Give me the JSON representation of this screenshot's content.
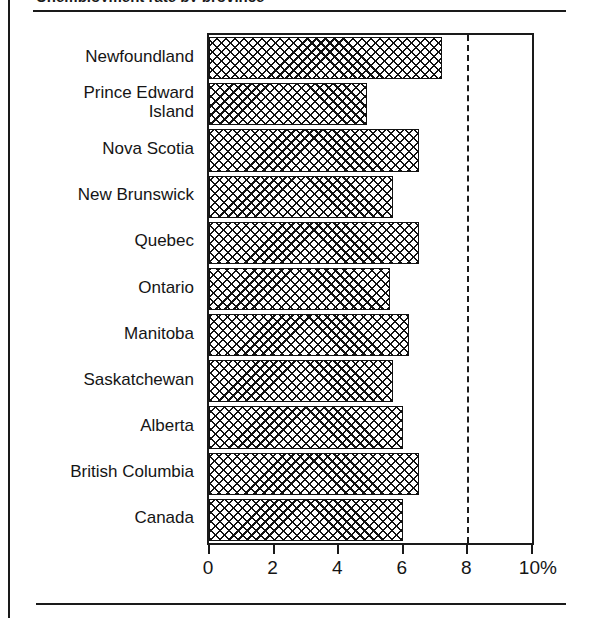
{
  "page": {
    "title_cropped": "Unemployment rate by province",
    "rules": {
      "top": true,
      "bottom": true,
      "left_border": true
    }
  },
  "chart_data": {
    "type": "bar",
    "orientation": "horizontal",
    "title": "",
    "xlabel": "",
    "ylabel": "",
    "categories": [
      "Newfoundland",
      "Prince Edward Island",
      "Nova Scotia",
      "New Brunswick",
      "Quebec",
      "Ontario",
      "Manitoba",
      "Saskatchewan",
      "Alberta",
      "British Columbia",
      "Canada"
    ],
    "category_labels_wrapped": [
      [
        "Newfoundland"
      ],
      [
        "Prince Edward",
        "Island"
      ],
      [
        "Nova Scotia"
      ],
      [
        "New Brunswick"
      ],
      [
        "Quebec"
      ],
      [
        "Ontario"
      ],
      [
        "Manitoba"
      ],
      [
        "Saskatchewan"
      ],
      [
        "Alberta"
      ],
      [
        "British Columbia"
      ],
      [
        "Canada"
      ]
    ],
    "values": [
      7.2,
      4.9,
      6.5,
      5.7,
      6.5,
      5.6,
      6.2,
      5.7,
      6.0,
      6.5,
      6.0
    ],
    "xlim": [
      0,
      10
    ],
    "xticks": [
      0,
      2,
      4,
      6,
      8,
      10
    ],
    "xticklabels": [
      "0",
      "2",
      "4",
      "6",
      "8",
      "10%"
    ],
    "grid": false,
    "legend": "none",
    "reference_line": {
      "value": 8,
      "style": "dashed"
    },
    "bar_fill": "crosshatch",
    "colors": {
      "ink": "#1a1a1a",
      "background": "#ffffff"
    }
  }
}
